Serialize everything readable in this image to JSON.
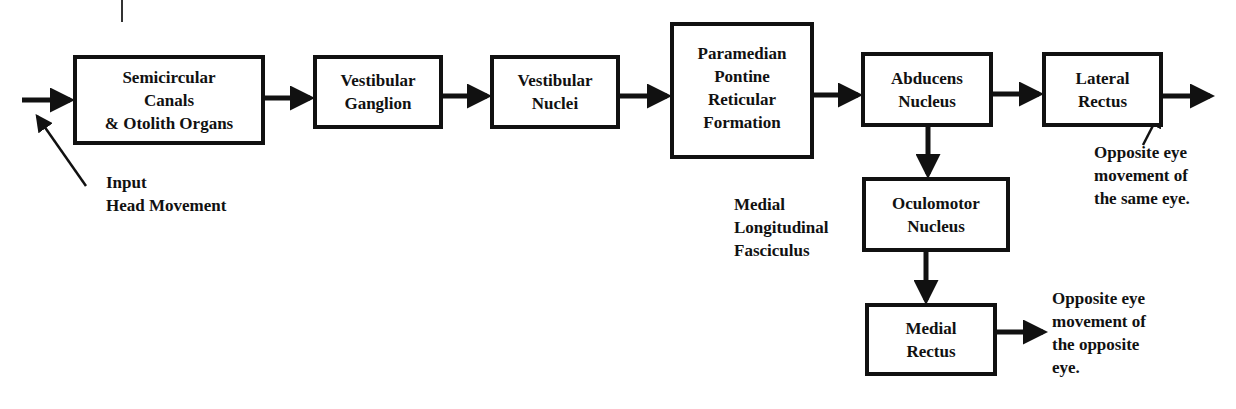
{
  "diagram": {
    "type": "flowchart",
    "nodes": {
      "semicircular": "Semicircular\nCanals\n& Otolith Organs",
      "ganglion": "Vestibular\nGanglion",
      "nuclei": "Vestibular\nNuclei",
      "pprf": "Paramedian\nPontine\nReticular\nFormation",
      "abducens": "Abducens\nNucleus",
      "lateral_rectus": "Lateral\nRectus",
      "oculomotor": "Oculomotor\nNucleus",
      "medial_rectus": "Medial\nRectus"
    },
    "labels": {
      "input": "Input\nHead Movement",
      "mlf": "Medial\nLongitudinal\nFasciculus",
      "same_eye": "Opposite eye\nmovement of\nthe same eye.",
      "opposite_eye": "Opposite eye\nmovement of\nthe opposite\neye."
    },
    "edges": [
      [
        "input",
        "semicircular"
      ],
      [
        "semicircular",
        "ganglion"
      ],
      [
        "ganglion",
        "nuclei"
      ],
      [
        "nuclei",
        "pprf"
      ],
      [
        "pprf",
        "abducens"
      ],
      [
        "abducens",
        "lateral_rectus"
      ],
      [
        "lateral_rectus",
        "same_eye_output"
      ],
      [
        "abducens",
        "oculomotor"
      ],
      [
        "oculomotor",
        "medial_rectus"
      ],
      [
        "medial_rectus",
        "opposite_eye_output"
      ]
    ],
    "colors": {
      "stroke": "#111111",
      "background": "#ffffff"
    }
  }
}
